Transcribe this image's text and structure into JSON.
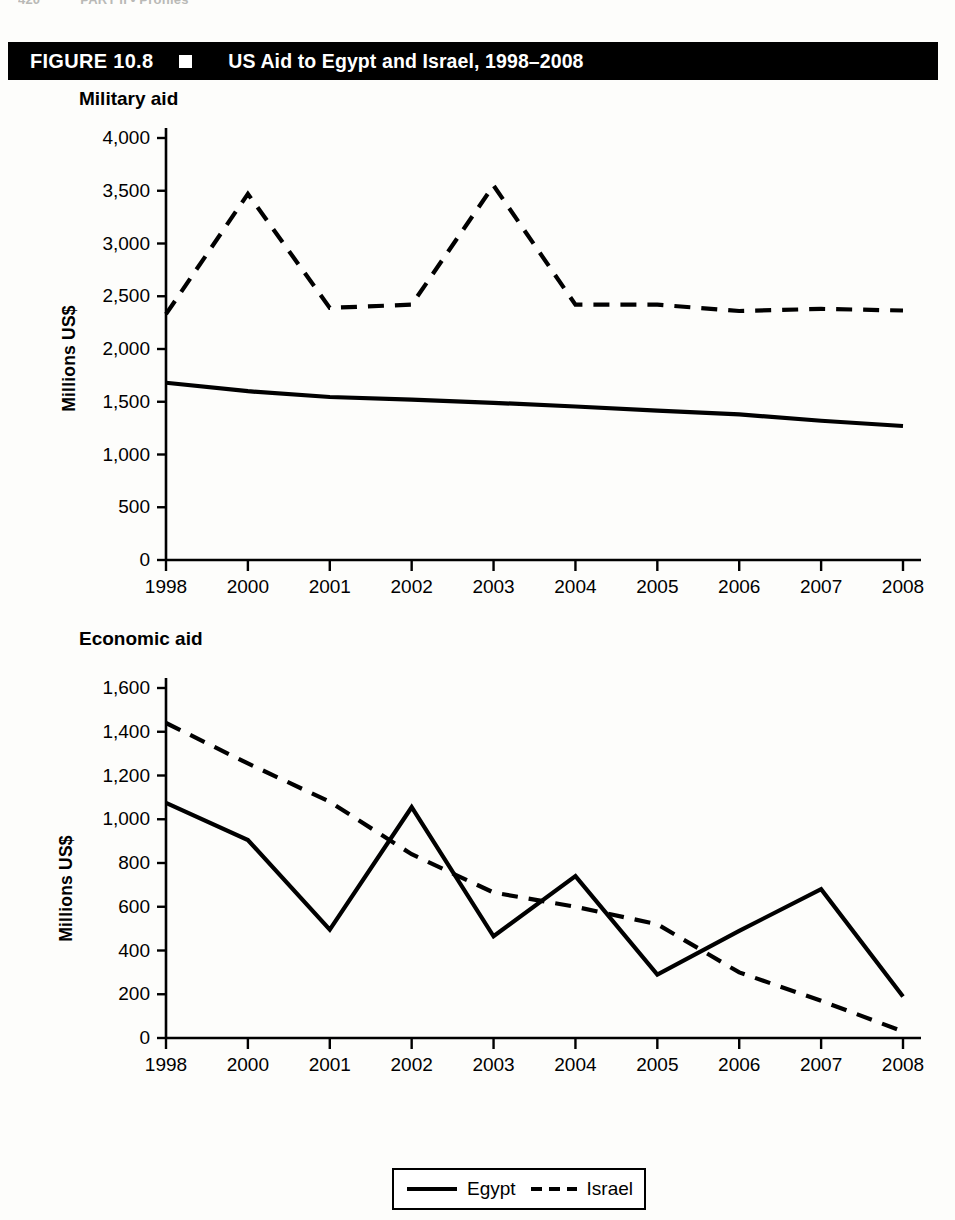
{
  "running_head": {
    "page_number": "420",
    "section": "PART II  •  Profiles"
  },
  "figure": {
    "number_label": "FIGURE 10.8",
    "marker_icon": "filled-square-icon",
    "title": "US Aid to Egypt and Israel, 1998–2008"
  },
  "legend": {
    "items": [
      {
        "label": "Egypt",
        "style": "solid"
      },
      {
        "label": "Israel",
        "style": "dashed"
      }
    ]
  },
  "chart_data": [
    {
      "type": "line",
      "title": "Military aid",
      "xlabel": "",
      "ylabel": "Millions US$",
      "categories": [
        "1998",
        "2000",
        "2001",
        "2002",
        "2003",
        "2004",
        "2005",
        "2006",
        "2007",
        "2008"
      ],
      "ylim": [
        0,
        4000
      ],
      "yticks": [
        0,
        500,
        1000,
        1500,
        2000,
        2500,
        3000,
        3500,
        4000
      ],
      "ytick_labels": [
        "0",
        "500",
        "1,000",
        "1,500",
        "2,000",
        "2,500",
        "3,000",
        "3,500",
        "4,000"
      ],
      "grid": false,
      "legend_position": "bottom",
      "series": [
        {
          "name": "Egypt",
          "style": "solid",
          "values": [
            1680,
            1600,
            1545,
            1520,
            1490,
            1455,
            1415,
            1380,
            1320,
            1270
          ]
        },
        {
          "name": "Israel",
          "style": "dashed",
          "values": [
            2330,
            3470,
            2390,
            2420,
            3550,
            2420,
            2420,
            2360,
            2380,
            2365
          ]
        }
      ]
    },
    {
      "type": "line",
      "title": "Economic aid",
      "xlabel": "",
      "ylabel": "Millions US$",
      "categories": [
        "1998",
        "2000",
        "2001",
        "2002",
        "2003",
        "2004",
        "2005",
        "2006",
        "2007",
        "2008"
      ],
      "ylim": [
        0,
        1600
      ],
      "yticks": [
        0,
        200,
        400,
        600,
        800,
        1000,
        1200,
        1400,
        1600
      ],
      "ytick_labels": [
        "0",
        "200",
        "400",
        "600",
        "800",
        "1,000",
        "1,200",
        "1,400",
        "1,600"
      ],
      "grid": false,
      "legend_position": "bottom",
      "series": [
        {
          "name": "Egypt",
          "style": "solid",
          "values": [
            1075,
            905,
            495,
            1055,
            465,
            740,
            290,
            490,
            680,
            190
          ]
        },
        {
          "name": "Israel",
          "style": "dashed",
          "values": [
            1440,
            1255,
            1080,
            840,
            665,
            600,
            520,
            300,
            170,
            30
          ]
        }
      ]
    }
  ]
}
